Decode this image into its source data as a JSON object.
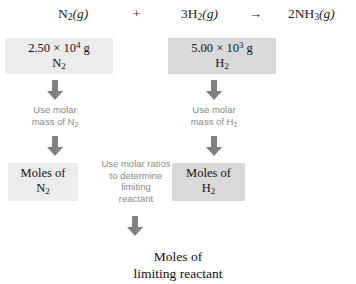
{
  "equation": {
    "reactant_1": "N2(g)",
    "reactant_1_formula": "N",
    "reactant_1_sub": "2",
    "reactant_1_state": "(g)",
    "plus_operator": "+",
    "reactant_2_coeff": "3H",
    "reactant_2_sub": "2",
    "reactant_2_state": "(g)",
    "yields_operator": "→",
    "product_coeff": "2NH",
    "product_sub": "3",
    "product_state": "(g)"
  },
  "branches": {
    "nitrogen": {
      "mass_value": "2.50 × 10",
      "mass_exponent": "4",
      "mass_unit": " g",
      "mass_species": "N",
      "mass_species_sub": "2",
      "step_caption_line_1": "Use molar",
      "step_caption_line_2": "mass of N",
      "step_caption_sub": "2",
      "moles_label": "Moles of",
      "moles_species": "N",
      "moles_species_sub": "2",
      "box_color": "#ececec"
    },
    "hydrogen": {
      "mass_value": "5.00 × 10",
      "mass_exponent": "3",
      "mass_unit": " g",
      "mass_species": "H",
      "mass_species_sub": "2",
      "step_caption_line_1": "Use molar",
      "step_caption_line_2": "mass of H",
      "step_caption_sub": "2",
      "moles_label": "Moles of",
      "moles_species": "H",
      "moles_species_sub": "2",
      "box_color": "#d9d9d9"
    }
  },
  "center_caption": {
    "line_1": "Use molar ratios",
    "line_2": "to determine",
    "line_3": "limiting",
    "line_4": "reactant"
  },
  "conclusion": {
    "line_1": "Moles of",
    "line_2": "limiting reactant"
  },
  "colors": {
    "arrow_gray": "#808080",
    "caption_gray": "#8a8a8a",
    "text_black": "#111111",
    "background": "#ffffff"
  }
}
